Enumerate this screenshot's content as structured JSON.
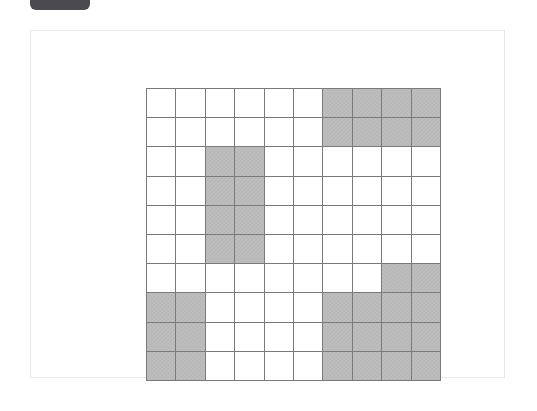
{
  "badge": {
    "name": "top-badge",
    "label": "",
    "color": "#4a4a4f"
  },
  "card": {
    "name": "content-card",
    "background": "#ffffff",
    "border_color": "#e9e9ec"
  },
  "chart_data": {
    "type": "heatmap",
    "title": "",
    "subtitle": "",
    "xlabel": "",
    "ylabel": "",
    "rows": 10,
    "columns": 10,
    "grid": true,
    "legend": null,
    "colors": {
      "filled": "#b4b4b4",
      "empty": "#ffffff",
      "gridline": "#7a7a7a"
    },
    "value_labels": {
      "0": "empty",
      "1": "shaded"
    },
    "row_labels": [
      "1",
      "2",
      "3",
      "4",
      "5",
      "6",
      "7",
      "8",
      "9",
      "10"
    ],
    "column_labels": [
      "1",
      "2",
      "3",
      "4",
      "5",
      "6",
      "7",
      "8",
      "9",
      "10"
    ],
    "values": [
      [
        0,
        0,
        0,
        0,
        0,
        0,
        1,
        1,
        1,
        1
      ],
      [
        0,
        0,
        0,
        0,
        0,
        0,
        1,
        1,
        1,
        1
      ],
      [
        0,
        0,
        1,
        1,
        0,
        0,
        0,
        0,
        0,
        0
      ],
      [
        0,
        0,
        1,
        1,
        0,
        0,
        0,
        0,
        0,
        0
      ],
      [
        0,
        0,
        1,
        1,
        0,
        0,
        0,
        0,
        0,
        0
      ],
      [
        0,
        0,
        1,
        1,
        0,
        0,
        0,
        0,
        0,
        0
      ],
      [
        0,
        0,
        0,
        0,
        0,
        0,
        0,
        0,
        1,
        1
      ],
      [
        1,
        1,
        0,
        0,
        0,
        0,
        1,
        1,
        1,
        1
      ],
      [
        1,
        1,
        0,
        0,
        0,
        0,
        1,
        1,
        1,
        1
      ],
      [
        1,
        1,
        0,
        0,
        0,
        0,
        1,
        1,
        1,
        1
      ]
    ],
    "filled_count": 38,
    "empty_count": 62
  }
}
